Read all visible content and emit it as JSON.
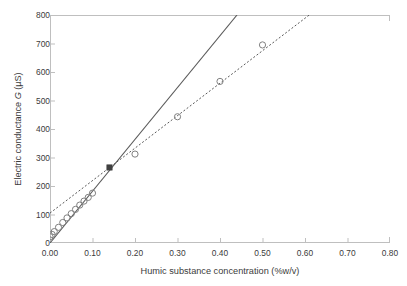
{
  "chart": {
    "type": "scatter",
    "title": "",
    "xlabel": "Humic substance concentration (%w/v)",
    "ylabel_prefix": "Electric conductance ",
    "ylabel_italic": "G",
    "ylabel_suffix": " (µS)",
    "ylabel_full": "Electric conductance G (µS)",
    "xlim": [
      0.0,
      0.8
    ],
    "ylim": [
      0,
      800
    ],
    "xticks": [
      "0.00",
      "0.10",
      "0.20",
      "0.30",
      "0.40",
      "0.50",
      "0.60",
      "0.70",
      "0.80"
    ],
    "xtick_values": [
      0.0,
      0.1,
      0.2,
      0.3,
      0.4,
      0.5,
      0.6,
      0.7,
      0.8
    ],
    "yticks": [
      "0",
      "100",
      "200",
      "300",
      "400",
      "500",
      "600",
      "700",
      "800"
    ],
    "ytick_values": [
      0,
      100,
      200,
      300,
      400,
      500,
      600,
      700,
      800
    ],
    "grid": false,
    "legend": "none",
    "marker_color": "#808080",
    "line_color": "#595959",
    "axis_color": "#bfbfbf",
    "text_color": "#3b3b3b"
  },
  "chart_data": {
    "type": "scatter",
    "title": "",
    "xlabel": "Humic substance concentration (%w/v)",
    "ylabel": "Electric conductance G (µS)",
    "xlim": [
      0.0,
      0.8
    ],
    "ylim": [
      0,
      800
    ],
    "grid": false,
    "legend": "none",
    "series": [
      {
        "name": "Measured conductance (open circles)",
        "marker": "open-circle",
        "x": [
          0.0,
          0.005,
          0.01,
          0.02,
          0.03,
          0.04,
          0.05,
          0.06,
          0.07,
          0.08,
          0.09,
          0.1,
          0.2,
          0.3,
          0.4,
          0.5
        ],
        "y": [
          22,
          30,
          40,
          55,
          72,
          88,
          103,
          118,
          133,
          147,
          160,
          175,
          312,
          443,
          567,
          695
        ]
      },
      {
        "name": "Intersection point (filled square)",
        "marker": "filled-square",
        "x": [
          0.14
        ],
        "y": [
          265
        ]
      }
    ],
    "fits": [
      {
        "name": "Low-concentration linear fit (solid line)",
        "style": "solid",
        "x": [
          0.0,
          0.44
        ],
        "y": [
          0,
          800
        ],
        "slope": 1818,
        "intercept": 0
      },
      {
        "name": "High-concentration linear fit (dotted line)",
        "style": "dotted",
        "x": [
          0.0,
          0.61
        ],
        "y": [
          105,
          800
        ],
        "slope": 1139,
        "intercept": 105
      }
    ]
  }
}
